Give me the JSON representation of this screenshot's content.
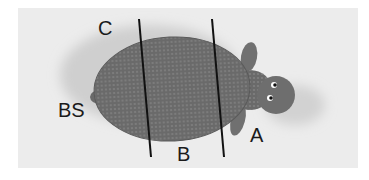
{
  "figure": {
    "colors": {
      "background": "#ffffff",
      "photo_backdrop": "#ececec",
      "shadow": "#cfcfcf",
      "body": "#6d6d6d",
      "body_dark": "#5a5a5a",
      "divider": "#111111"
    },
    "labels": [
      {
        "id": "C",
        "text": "C",
        "x": 98,
        "y": 18
      },
      {
        "id": "BS",
        "text": "BS",
        "x": 58,
        "y": 100
      },
      {
        "id": "B",
        "text": "B",
        "x": 177,
        "y": 144
      },
      {
        "id": "A",
        "text": "A",
        "x": 250,
        "y": 125
      }
    ],
    "dividers": [
      {
        "id": "line-1",
        "x1": 139,
        "y1": 19,
        "x2": 151,
        "y2": 157
      },
      {
        "id": "line-2",
        "x1": 212,
        "y1": 19,
        "x2": 224,
        "y2": 157
      }
    ]
  }
}
